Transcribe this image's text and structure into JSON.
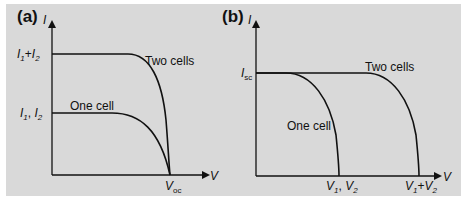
{
  "figure": {
    "background_color": "#d9d9d9",
    "line_color": "#111111",
    "panels": [
      {
        "id": "a",
        "label": "(a)",
        "y_axis_label": "I",
        "x_axis_label": "V",
        "y_ticks": [
          {
            "main": "I",
            "sub1": "1",
            "plus": "+",
            "main2": "I",
            "sub2": "2",
            "text": "I1+I2"
          },
          {
            "main": "I",
            "sub1": "1",
            "sep": ", ",
            "main2": "I",
            "sub2": "2",
            "text": "I1, I2"
          }
        ],
        "x_ticks": [
          {
            "main": "V",
            "sub": "oc",
            "text": "Voc"
          }
        ],
        "curves": [
          {
            "name": "Two cells",
            "label": "Two cells"
          },
          {
            "name": "One cell",
            "label": "One cell"
          }
        ]
      },
      {
        "id": "b",
        "label": "(b)",
        "y_axis_label": "I",
        "x_axis_label": "V",
        "y_ticks": [
          {
            "main": "I",
            "sub": "sc",
            "text": "Isc"
          }
        ],
        "x_ticks": [
          {
            "main": "V",
            "sub1": "1",
            "sep": ", ",
            "main2": "V",
            "sub2": "2",
            "text": "V1, V2"
          },
          {
            "main": "V",
            "sub1": "1",
            "plus": "+",
            "main2": "V",
            "sub2": "2",
            "text": "V1+V2"
          }
        ],
        "curves": [
          {
            "name": "One cell",
            "label": "One cell"
          },
          {
            "name": "Two cells",
            "label": "Two cells"
          }
        ]
      }
    ]
  }
}
